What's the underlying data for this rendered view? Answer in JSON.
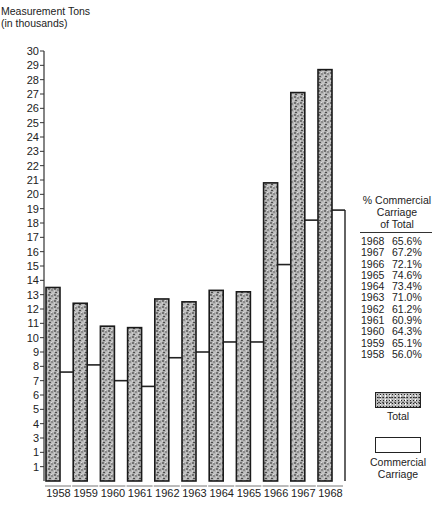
{
  "chart_data": {
    "type": "bar",
    "title": "",
    "ylabel": "Measurement Tons (in thousands)",
    "xlabel": "",
    "ylim": [
      0,
      30
    ],
    "y_ticks_printed": [
      "30",
      "29",
      "28",
      "27",
      "26",
      "25",
      "24",
      "23",
      "22",
      "21",
      "20",
      "19",
      "18",
      "17",
      "16",
      "15",
      "14",
      "13",
      "12",
      "11",
      "10",
      "9",
      "8",
      "7",
      "6",
      "5",
      "4",
      "3",
      "1",
      "1"
    ],
    "categories": [
      "1958",
      "1959",
      "1960",
      "1961",
      "1962",
      "1963",
      "1964",
      "1965",
      "1966",
      "1967",
      "1968"
    ],
    "series": [
      {
        "name": "Total",
        "style": "stippled",
        "values": [
          13.5,
          12.4,
          10.8,
          10.7,
          12.7,
          12.5,
          13.3,
          13.2,
          20.8,
          27.1,
          28.7
        ]
      },
      {
        "name": "Commercial Carriage",
        "style": "white",
        "values": [
          7.6,
          8.1,
          7.0,
          6.6,
          8.6,
          9.0,
          9.7,
          9.7,
          15.1,
          18.2,
          18.9
        ]
      }
    ],
    "legend": {
      "position": "right",
      "entries": [
        "Total",
        "Commercial Carriage"
      ]
    },
    "annotation_table": {
      "header": [
        "% Commercial",
        "Carriage",
        "of Total"
      ],
      "rows": [
        {
          "year": "1968",
          "pct": "65.6%"
        },
        {
          "year": "1967",
          "pct": "67.2%"
        },
        {
          "year": "1966",
          "pct": "72.1%"
        },
        {
          "year": "1965",
          "pct": "74.6%"
        },
        {
          "year": "1964",
          "pct": "73.4%"
        },
        {
          "year": "1963",
          "pct": "71.0%"
        },
        {
          "year": "1962",
          "pct": "61.2%"
        },
        {
          "year": "1961",
          "pct": "60.9%"
        },
        {
          "year": "1960",
          "pct": "64.3%"
        },
        {
          "year": "1959",
          "pct": "65.1%"
        },
        {
          "year": "1958",
          "pct": "56.0%"
        }
      ]
    },
    "grid": false
  },
  "labels": {
    "y_title_line1": "Measurement Tons",
    "y_title_line2": "(in thousands)",
    "legend_total": "Total",
    "legend_comm_line1": "Commercial",
    "legend_comm_line2": "Carriage"
  }
}
